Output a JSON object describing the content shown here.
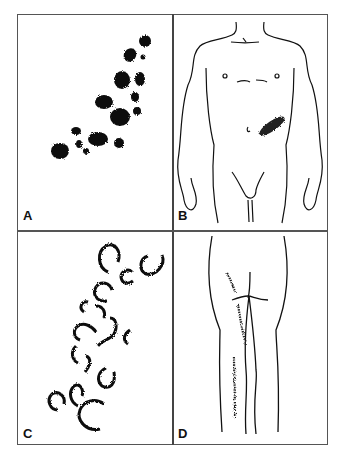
{
  "figure": {
    "panels": [
      {
        "id": "A",
        "label": "A",
        "content": "clustered papular lesions (dark blotches)"
      },
      {
        "id": "B",
        "label": "B",
        "content": "male front body outline with lesion cluster on left flank"
      },
      {
        "id": "C",
        "label": "C",
        "content": "annular / arciform ring lesions"
      },
      {
        "id": "D",
        "label": "D",
        "content": "posterior legs outline with linear lesion streaks"
      }
    ]
  }
}
